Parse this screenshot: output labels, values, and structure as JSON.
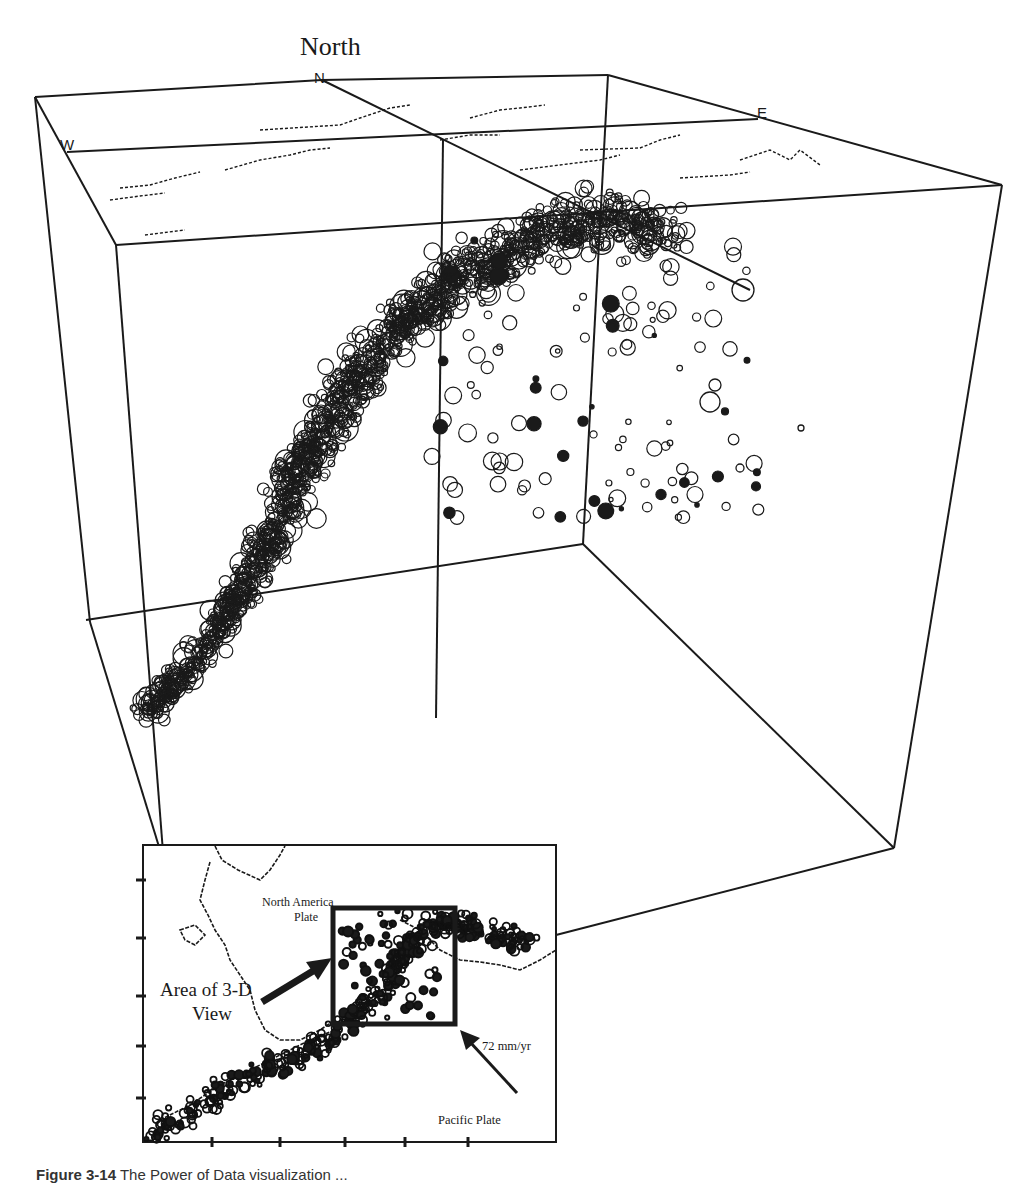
{
  "figure": {
    "title_label": "North",
    "compass": {
      "north": "N",
      "west": "W",
      "east": "E"
    },
    "inset": {
      "north_america_line1": "North America",
      "north_america_line2": "Plate",
      "area_line1": "Area of 3-D",
      "area_line2": "View",
      "rate": "72 mm/yr",
      "pacific": "Pacific Plate"
    },
    "caption": {
      "label": "Figure 3-14",
      "text": "The Power of Data visualization ..."
    },
    "colors": {
      "ink": "#1a1a1a",
      "background": "#ffffff"
    }
  }
}
